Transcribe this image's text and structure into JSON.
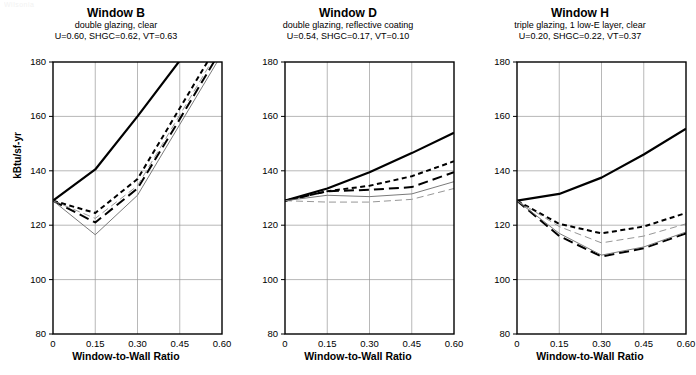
{
  "figure": {
    "corner_note": "Wilsonia",
    "ylabel": "kBtu/sf-yr",
    "xlabel": "Window-to-Wall Ratio",
    "ylim": [
      80,
      180
    ],
    "xlim": [
      0,
      0.6
    ],
    "yticks": [
      "80",
      "100",
      "120",
      "140",
      "160",
      "180"
    ],
    "ytick_values": [
      80,
      100,
      120,
      140,
      160,
      180
    ],
    "xticks": [
      "0",
      "0.15",
      "0.30",
      "0.45",
      "0.60"
    ],
    "xtick_values": [
      0,
      0.15,
      0.3,
      0.45,
      0.6
    ]
  },
  "panels": [
    {
      "title": "Window B",
      "subtitle": "double glazing, clear",
      "properties": "U=0.60, SHGC=0.62, VT=0.63"
    },
    {
      "title": "Window D",
      "subtitle": "double glazing, reflective coating",
      "properties": "U=0.54, SHGC=0.17, VT=0.10"
    },
    {
      "title": "Window H",
      "subtitle": "triple glazing, 1 low-E layer, clear",
      "properties": "U=0.20, SHGC=0.22, VT=0.37"
    }
  ],
  "chart_data": [
    {
      "type": "line",
      "title": "Window B",
      "subtitle": "double glazing, clear",
      "annotation": "U=0.60, SHGC=0.62, VT=0.63",
      "xlabel": "Window-to-Wall Ratio",
      "ylabel": "kBtu/sf-yr",
      "xlim": [
        0,
        0.6
      ],
      "ylim": [
        80,
        180
      ],
      "grid": true,
      "legend": "none",
      "x": [
        0,
        0.15,
        0.3,
        0.45,
        0.6
      ],
      "series": [
        {
          "name": "series-1",
          "style": "solid-thick",
          "values": [
            129,
            140.5,
            160.0,
            180.5,
            200.0
          ]
        },
        {
          "name": "series-2",
          "style": "short-dash",
          "values": [
            129,
            124.5,
            137.0,
            163.0,
            189.0
          ]
        },
        {
          "name": "series-3",
          "style": "long-dash",
          "values": [
            129,
            121.0,
            133.5,
            159.0,
            185.0
          ]
        },
        {
          "name": "series-4",
          "style": "thin-solid",
          "values": [
            129,
            116.5,
            131.0,
            157.0,
            183.0
          ]
        },
        {
          "name": "series-5",
          "style": "thin-dash",
          "values": [
            129,
            122.5,
            134.5,
            160.5,
            186.5
          ]
        }
      ]
    },
    {
      "type": "line",
      "title": "Window D",
      "subtitle": "double glazing, reflective coating",
      "annotation": "U=0.54, SHGC=0.17, VT=0.10",
      "xlabel": "Window-to-Wall Ratio",
      "ylabel": "kBtu/sf-yr",
      "xlim": [
        0,
        0.6
      ],
      "ylim": [
        80,
        180
      ],
      "grid": true,
      "legend": "none",
      "x": [
        0,
        0.15,
        0.3,
        0.45,
        0.6
      ],
      "series": [
        {
          "name": "series-1",
          "style": "solid-thick",
          "values": [
            129,
            133.5,
            139.5,
            146.5,
            154.0
          ]
        },
        {
          "name": "series-2",
          "style": "short-dash",
          "values": [
            129,
            132.5,
            134.5,
            138.0,
            143.5
          ]
        },
        {
          "name": "series-3",
          "style": "long-dash",
          "values": [
            129,
            132.5,
            133.0,
            134.0,
            139.5
          ]
        },
        {
          "name": "series-4",
          "style": "thin-solid",
          "values": [
            129,
            131.0,
            130.5,
            131.5,
            136.0
          ]
        },
        {
          "name": "series-5",
          "style": "thin-dash",
          "values": [
            129,
            128.5,
            128.5,
            129.5,
            133.5
          ]
        }
      ]
    },
    {
      "type": "line",
      "title": "Window H",
      "subtitle": "triple glazing, 1 low-E layer, clear",
      "annotation": "U=0.20, SHGC=0.22, VT=0.37",
      "xlabel": "Window-to-Wall Ratio",
      "ylabel": "kBtu/sf-yr",
      "xlim": [
        0,
        0.6
      ],
      "ylim": [
        80,
        180
      ],
      "grid": true,
      "legend": "none",
      "x": [
        0,
        0.15,
        0.3,
        0.45,
        0.6
      ],
      "series": [
        {
          "name": "series-1",
          "style": "solid-thick",
          "values": [
            129,
            131.5,
            137.5,
            146.0,
            155.5
          ]
        },
        {
          "name": "series-2",
          "style": "short-dash",
          "values": [
            129,
            120.5,
            117.0,
            119.5,
            124.5
          ]
        },
        {
          "name": "series-3",
          "style": "long-dash",
          "values": [
            129,
            116.0,
            108.5,
            111.5,
            117.0
          ]
        },
        {
          "name": "series-4",
          "style": "thin-solid",
          "values": [
            129,
            117.0,
            109.0,
            112.0,
            117.5
          ]
        },
        {
          "name": "series-5",
          "style": "thin-dash",
          "values": [
            129,
            119.5,
            113.5,
            116.0,
            120.5
          ]
        }
      ]
    }
  ]
}
